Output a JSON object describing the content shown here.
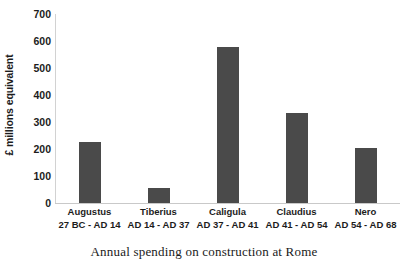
{
  "chart_data": {
    "type": "bar",
    "title": "",
    "caption": "Annual spending on construction at Rome",
    "xlabel": "",
    "ylabel": "£ millions equivalent",
    "ylim": [
      0,
      700
    ],
    "ytick_step": 100,
    "yticks": [
      700,
      600,
      500,
      400,
      300,
      200,
      100,
      0
    ],
    "grid": false,
    "legend": "none",
    "bar_color": "#4a4a4a",
    "axis_color": "#c9c9c9",
    "categories": [
      "Augustus",
      "Tiberius",
      "Caligula",
      "Claudius",
      "Nero"
    ],
    "category_ranges": [
      "27 BC - AD 14",
      "AD 14 - AD 37",
      "AD 37 - AD 41",
      "AD 41 - AD 54",
      "AD 54 - AD 68"
    ],
    "values": [
      225,
      55,
      578,
      335,
      205
    ],
    "bars": [
      {
        "label": "Augustus",
        "range": "27 BC - AD 14",
        "value": 225
      },
      {
        "label": "Tiberius",
        "range": "AD 14 - AD 37",
        "value": 55
      },
      {
        "label": "Caligula",
        "range": "AD 37 - AD 41",
        "value": 578
      },
      {
        "label": "Claudius",
        "range": "AD 41 - AD 54",
        "value": 335
      },
      {
        "label": "Nero",
        "range": "AD 54 - AD 68",
        "value": 205
      }
    ]
  }
}
